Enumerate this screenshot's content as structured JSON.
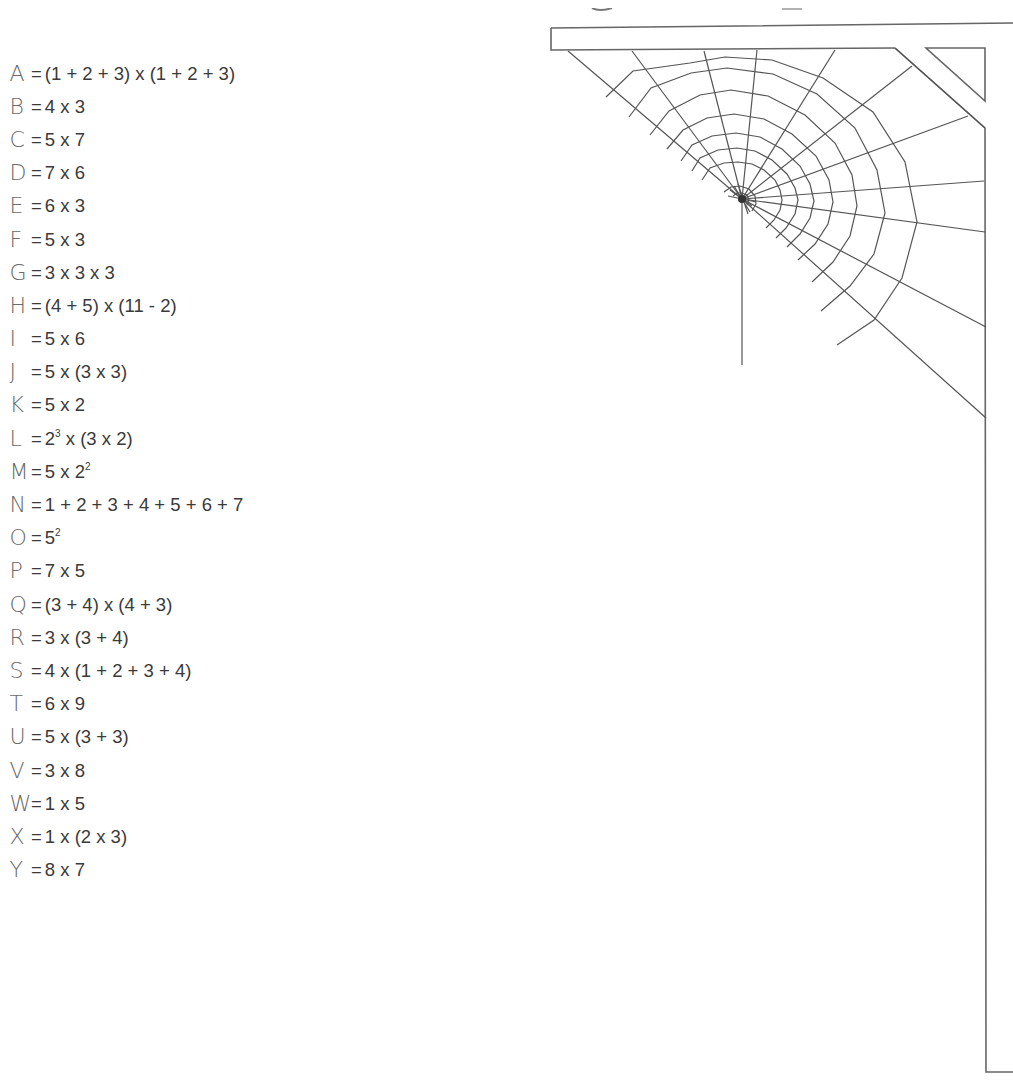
{
  "worksheet": {
    "codes": [
      {
        "letter": "A",
        "expr": "(1 + 2 + 3) x (1 + 2 + 3)"
      },
      {
        "letter": "B",
        "expr": "4 x 3"
      },
      {
        "letter": "C",
        "expr": "5 x 7"
      },
      {
        "letter": "D",
        "expr": "7 x 6"
      },
      {
        "letter": "E",
        "expr": "6 x 3"
      },
      {
        "letter": "F",
        "expr": "5 x 3"
      },
      {
        "letter": "G",
        "expr": "3 x 3 x 3"
      },
      {
        "letter": "H",
        "expr": "(4 + 5) x (11 - 2)"
      },
      {
        "letter": "I",
        "expr": "5 x 6"
      },
      {
        "letter": "J",
        "expr": "5 x (3 x 3)"
      },
      {
        "letter": "K",
        "expr": "5 x 2"
      },
      {
        "letter": "L",
        "expr_parts": [
          "2",
          "3",
          " x (3 x 2)"
        ],
        "expr": "2³ x (3 x 2)"
      },
      {
        "letter": "M",
        "expr_parts": [
          "5 x 2",
          "2",
          ""
        ],
        "expr": "5 x 2²"
      },
      {
        "letter": "N",
        "expr": "1 + 2 + 3 + 4 + 5 + 6 + 7"
      },
      {
        "letter": "O",
        "expr_parts": [
          "5",
          "2",
          ""
        ],
        "expr": "5²"
      },
      {
        "letter": "P",
        "expr": "7 x 5"
      },
      {
        "letter": "Q",
        "expr": "(3 + 4) x (4 + 3)"
      },
      {
        "letter": "R",
        "expr": "3 x (3 + 4)"
      },
      {
        "letter": "S",
        "expr": "4 x (1 + 2 + 3 + 4)"
      },
      {
        "letter": "T",
        "expr": "6 x 9"
      },
      {
        "letter": "U",
        "expr": "5 x (3 + 3)"
      },
      {
        "letter": "V",
        "expr": "3 x 8"
      },
      {
        "letter": "W",
        "expr": "1 x 5"
      },
      {
        "letter": "X",
        "expr": "1 x (2 x 3)"
      },
      {
        "letter": "Y",
        "expr": "8 x 7"
      }
    ],
    "equals_sign": "=",
    "illustration": {
      "name": "spider-web-corner",
      "stroke_color": "#555555",
      "frame_color": "#666666"
    }
  }
}
